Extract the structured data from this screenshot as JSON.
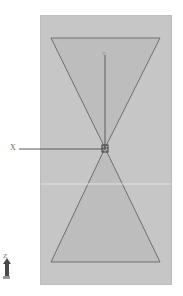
{
  "diagram": {
    "type": "cad-viewport",
    "viewport_color": "#c6c6c6",
    "shape_fill": "#bdbdbd",
    "edge_color": "#6e6e6e",
    "axes": {
      "x_label": "X",
      "y_label": "Y",
      "z_label": "Z"
    },
    "shapes": [
      {
        "name": "upper-triangle",
        "points": [
          [
            51,
            38
          ],
          [
            160,
            38
          ],
          [
            105,
            148
          ]
        ]
      },
      {
        "name": "lower-triangle",
        "points": [
          [
            105,
            148
          ],
          [
            51,
            262
          ],
          [
            160,
            262
          ]
        ]
      }
    ],
    "origin": [
      105,
      148
    ]
  }
}
